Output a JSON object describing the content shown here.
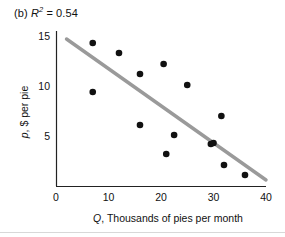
{
  "figure": {
    "panel_prefix": "(b)",
    "stat_symbol": "R",
    "stat_exponent": "2",
    "stat_equals": "=",
    "stat_value": "0.54",
    "panel_label_full": "(b) R2 = 0.54"
  },
  "colors": {
    "point": "#111111",
    "trend_line": "#9a9a9a",
    "axis": "#222222",
    "text": "#111111",
    "background": "#ffffff"
  },
  "chart_data": {
    "type": "scatter",
    "title": "(b) R2 = 0.54",
    "xlabel": "Q, Thousands of pies per month",
    "ylabel": "p, $ per pie",
    "xlabel_italic_prefix": "Q",
    "xlabel_rest": ", Thousands of pies per month",
    "ylabel_italic_prefix": "p",
    "ylabel_rest": ", $ per pie",
    "xlim": [
      0,
      40
    ],
    "ylim": [
      0,
      16
    ],
    "xticks": [
      0,
      10,
      20,
      30,
      40
    ],
    "yticks": [
      5,
      10,
      15
    ],
    "xtick_labels": [
      "0",
      "10",
      "20",
      "30",
      "40"
    ],
    "ytick_labels": [
      "5",
      "10",
      "15"
    ],
    "grid": false,
    "legend": false,
    "r_squared": 0.54,
    "points": [
      {
        "x": 7.0,
        "y": 14.3
      },
      {
        "x": 7.0,
        "y": 9.4
      },
      {
        "x": 12.0,
        "y": 13.3
      },
      {
        "x": 16.0,
        "y": 11.2
      },
      {
        "x": 16.0,
        "y": 6.1
      },
      {
        "x": 20.5,
        "y": 12.2
      },
      {
        "x": 21.0,
        "y": 3.2
      },
      {
        "x": 22.5,
        "y": 5.1
      },
      {
        "x": 25.0,
        "y": 10.1
      },
      {
        "x": 29.5,
        "y": 4.2
      },
      {
        "x": 31.5,
        "y": 7.0
      },
      {
        "x": 32.0,
        "y": 2.1
      },
      {
        "x": 36.0,
        "y": 1.1
      },
      {
        "x": 30.0,
        "y": 4.3
      }
    ],
    "trend_line": {
      "x_start": 2.0,
      "y_start": 14.7,
      "x_end": 40.0,
      "y_end": 0.6,
      "slope": -0.371,
      "intercept": 15.44
    }
  }
}
